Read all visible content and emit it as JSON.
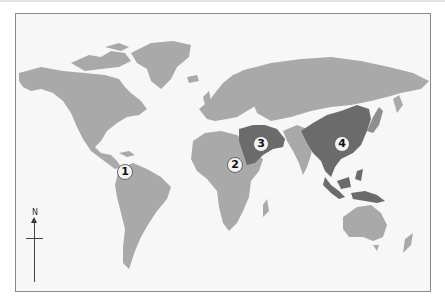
{
  "map": {
    "type": "world-political-outline",
    "colors": {
      "background": "#f7f7f7",
      "frame": "#8a8a8a",
      "land": "#a9a9a9",
      "highlight": "#6b6b6b",
      "marker_fill": "#f4f4f4",
      "marker_text": "#111111"
    },
    "markers": [
      {
        "label": "1",
        "region": "Northern South America / Central America"
      },
      {
        "label": "2",
        "region": "Central Africa (Sahel)"
      },
      {
        "label": "3",
        "region": "Middle East (Fertile Crescent)"
      },
      {
        "label": "4",
        "region": "East Asia (China)"
      }
    ],
    "highlighted_regions": [
      "Middle East",
      "East and Southeast Asia"
    ],
    "compass": {
      "label": "N"
    }
  }
}
